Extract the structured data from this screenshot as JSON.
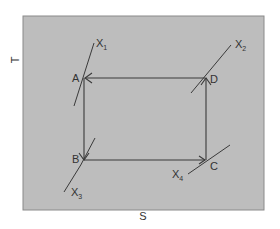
{
  "diagram": {
    "axes": {
      "x_label": "S",
      "y_label": "T"
    },
    "colors": {
      "panel_fill": "#bdbdbd",
      "panel_border": "#8a8a8a",
      "line": "#3a3a3a",
      "text": "#333333"
    },
    "points": [
      {
        "id": "A",
        "label": "A"
      },
      {
        "id": "B",
        "label": "B"
      },
      {
        "id": "C",
        "label": "C"
      },
      {
        "id": "D",
        "label": "D"
      }
    ],
    "curves": [
      {
        "id": "X1",
        "label": "X",
        "sub": "1"
      },
      {
        "id": "X2",
        "label": "X",
        "sub": "2"
      },
      {
        "id": "X3",
        "label": "X",
        "sub": "3"
      },
      {
        "id": "X4",
        "label": "X",
        "sub": "4"
      }
    ],
    "cycle": [
      "A",
      "B",
      "C",
      "D",
      "A"
    ]
  }
}
